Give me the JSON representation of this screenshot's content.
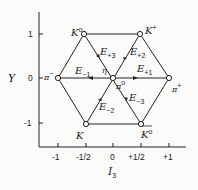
{
  "diagram": {
    "type": "weight-diagram",
    "x_axis": {
      "label": "I",
      "label_sub": "3",
      "ticks": [
        "-1",
        "-1/2",
        "0",
        "+1/2",
        "+1"
      ]
    },
    "y_axis": {
      "label": "Y",
      "ticks": [
        "1",
        "0",
        "-1"
      ]
    },
    "nodes": {
      "k0": {
        "name": "K",
        "sup": "o"
      },
      "kplus": {
        "name": "K",
        "sup": "+"
      },
      "piminus": {
        "name": "π",
        "sup": "−"
      },
      "piplus": {
        "name": "π",
        "sup": "+"
      },
      "kminus": {
        "name": "K",
        "sup": ""
      },
      "k0bar": {
        "name": "K",
        "sup": "o"
      },
      "pi0": {
        "name": "π",
        "sup": "o"
      },
      "eta": {
        "name": "η"
      }
    },
    "operators": {
      "e_p3": {
        "name": "E",
        "sub": "+3"
      },
      "e_p2": {
        "name": "E",
        "sub": "+2"
      },
      "e_m1": {
        "name": "E",
        "sub": "−1"
      },
      "e_p1": {
        "name": "E",
        "sub": "+1"
      },
      "e_m2": {
        "name": "E",
        "sub": "−2"
      },
      "e_m3": {
        "name": "E",
        "sub": "−3"
      }
    },
    "colors": {
      "line": "#222222",
      "background": "#fbfbfa"
    }
  }
}
